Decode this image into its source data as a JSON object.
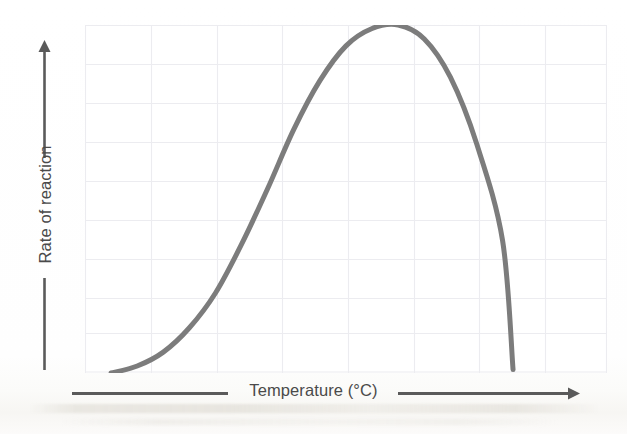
{
  "figure": {
    "background_color": "#ffffff",
    "axis_line_color": "#5a5a5a",
    "label_text_color": "#4a4a4a",
    "gridline_color": "#ececf0",
    "curve_color": "#7c7c7c"
  },
  "axes": {
    "x": {
      "label": "Temperature (°C)",
      "arrow_direction": "right",
      "has_tick_labels": false
    },
    "y": {
      "label": "Rate of reaction",
      "arrow_direction": "up",
      "has_tick_labels": false
    }
  },
  "chart_data": {
    "type": "line",
    "title": "",
    "subtitle": "",
    "xlabel": "Temperature (°C)",
    "ylabel": "Rate of reaction",
    "xlim": [
      0,
      100
    ],
    "ylim": [
      0,
      100
    ],
    "grid": true,
    "grid_x_divisions": 8,
    "grid_y_divisions": 9,
    "legend": false,
    "legend_position": "none",
    "annotations": [],
    "series": [
      {
        "name": "Rate of reaction vs temperature",
        "color": "#7c7c7c",
        "line_width": 5,
        "x": [
          5,
          10,
          15,
          20,
          25,
          30,
          35,
          40,
          45,
          50,
          55,
          60,
          65,
          70,
          75,
          80,
          82
        ],
        "y": [
          0,
          2,
          6,
          13,
          23,
          37,
          53,
          70,
          84,
          94,
          99,
          100,
          96,
          85,
          66,
          38,
          1
        ]
      }
    ]
  }
}
